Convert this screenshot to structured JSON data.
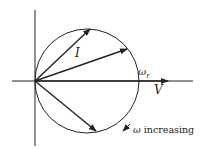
{
  "diagram": {
    "type": "phasor circle diagram",
    "labels": {
      "current": "I",
      "voltage": "V",
      "resonant_freq": "ω",
      "resonant_sub": "r",
      "direction_omega": "ω",
      "direction_text": "increasing"
    },
    "colors": {
      "ink": "#222222",
      "background": "#ffffff"
    },
    "geometry": {
      "origin": [
        35,
        81
      ],
      "circle_center": [
        87,
        81
      ],
      "circle_radius": 52,
      "phasor_tips": [
        [
          90,
          29
        ],
        [
          127,
          49
        ],
        [
          96,
          131
        ]
      ],
      "v_axis_end": 168
    }
  }
}
